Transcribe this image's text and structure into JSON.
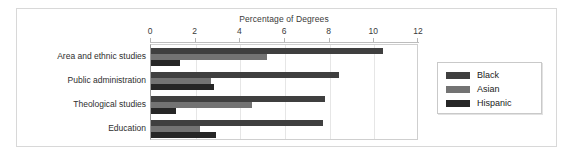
{
  "figure": {
    "title": "Percentage of Degrees"
  },
  "legend": {
    "position": "right",
    "items": [
      {
        "label": "Black",
        "color": "#3f3f3f"
      },
      {
        "label": "Asian",
        "color": "#737373"
      },
      {
        "label": "Hispanic",
        "color": "#262626"
      }
    ]
  },
  "axis": {
    "ticks": [
      "0",
      "2",
      "4",
      "6",
      "8",
      "10",
      "12"
    ]
  },
  "chart_data": {
    "type": "bar",
    "orientation": "horizontal",
    "title": "Percentage of Degrees",
    "xlabel": "",
    "ylabel": "",
    "xlim": [
      0,
      12
    ],
    "xticks": [
      0,
      2,
      4,
      6,
      8,
      10,
      12
    ],
    "grid": true,
    "legend_position": "right",
    "categories": [
      "Area and ethnic studies",
      "Public administration",
      "Theological studies",
      "Education"
    ],
    "series": [
      {
        "name": "Black",
        "color": "#3f3f3f",
        "values": [
          10.4,
          8.4,
          7.8,
          7.7
        ]
      },
      {
        "name": "Asian",
        "color": "#737373",
        "values": [
          5.2,
          2.7,
          4.5,
          2.2
        ]
      },
      {
        "name": "Hispanic",
        "color": "#262626",
        "values": [
          1.3,
          2.8,
          1.1,
          2.9
        ]
      }
    ]
  }
}
